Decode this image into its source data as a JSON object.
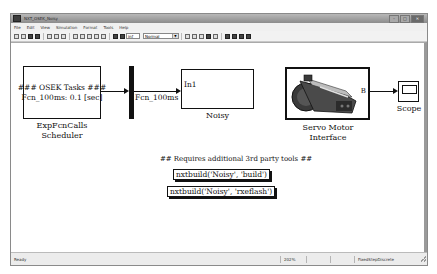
{
  "window": {
    "title": "NXT_OSEK_Noisy",
    "controls": [
      "minimize",
      "maximize",
      "close"
    ]
  },
  "menubar": {
    "items": [
      "File",
      "Edit",
      "View",
      "Simulation",
      "Format",
      "Tools",
      "Help"
    ]
  },
  "toolbar": {
    "icons": [
      "new-icon",
      "open-icon",
      "save-icon",
      "print-icon",
      "cut-icon",
      "copy-icon",
      "paste-icon",
      "back-icon",
      "forward-icon",
      "up-icon",
      "undo-icon",
      "redo-icon",
      "start-icon",
      "stop-icon"
    ],
    "stop_time": "inf",
    "sim_mode": "Normal",
    "right_icons": [
      "build-icon",
      "update-icon",
      "library-icon",
      "explorer-icon",
      "debug-icon",
      "model-advisor-icon",
      "config-icon",
      "signal-icon",
      "scope-icon"
    ]
  },
  "diagram": {
    "scheduler": {
      "line1": "### OSEK Tasks ###",
      "line2": "Fcn_100ms: 0.1 [sec]",
      "label_line1": "ExpFcnCalls",
      "label_line2": "Scheduler"
    },
    "signal_label": "Fcn_100ms",
    "noisy": {
      "port": "In1",
      "label": "Noisy"
    },
    "servo": {
      "port": "B",
      "label_line1": "Servo Motor",
      "label_line2": "Interface"
    },
    "scope": {
      "label": "Scope"
    },
    "comment": "## Requires additional 3rd party tools ##",
    "commands": {
      "build": "nxtbuild('Noisy', 'build')",
      "flash": "nxtbuild('Noisy', 'rxeflash')"
    }
  },
  "statusbar": {
    "status": "Ready",
    "zoom": "202%",
    "cell2": "",
    "cell3": "",
    "solver": "FixedStepDiscrete"
  }
}
